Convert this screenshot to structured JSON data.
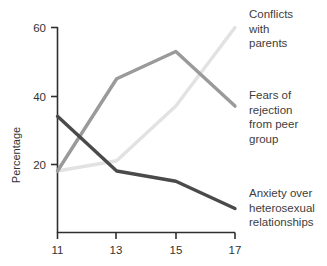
{
  "chart_data": {
    "type": "line",
    "title": "",
    "xlabel": "",
    "ylabel": "Percentage",
    "x": [
      11,
      13,
      15,
      17
    ],
    "xticks": [
      "11",
      "13",
      "15",
      "17"
    ],
    "yticks": [
      "20",
      "40",
      "60"
    ],
    "ytick_values": [
      20,
      40,
      60
    ],
    "xlim": [
      11,
      17
    ],
    "ylim": [
      0,
      60
    ],
    "grid": false,
    "legend_position": "right-inline-annotations",
    "series": [
      {
        "name": "Conflicts with parents",
        "label_lines": "Conflicts\nwith\nparents",
        "color": "#e2e2e2",
        "values": [
          18,
          21,
          37,
          60
        ]
      },
      {
        "name": "Fears of rejection from peer group",
        "label_lines": "Fears of\nrejection\nfrom peer\ngroup",
        "color": "#9a9a9a",
        "values": [
          18,
          45,
          53,
          37
        ]
      },
      {
        "name": "Anxiety over heterosexual relationships",
        "label_lines": "Anxiety over\nheterosexual\nrelationships",
        "color": "#4a4a4a",
        "values": [
          34,
          18,
          15,
          7
        ]
      }
    ]
  },
  "axes": {
    "y_title": "Percentage",
    "tick_60": "60",
    "tick_40": "40",
    "tick_20": "20",
    "tick_11": "11",
    "tick_13": "13",
    "tick_15": "15",
    "tick_17": "17"
  },
  "annotations": {
    "conflicts": "Conflicts\nwith\nparents",
    "fears": "Fears of\nrejection\nfrom peer\ngroup",
    "anxiety": "Anxiety over\nheterosexual\nrelationships"
  },
  "colors": {
    "series_light": "#e2e2e2",
    "series_mid": "#9a9a9a",
    "series_dark": "#4a4a4a",
    "axis": "#2f2f2f",
    "text": "#3d3d3d"
  }
}
